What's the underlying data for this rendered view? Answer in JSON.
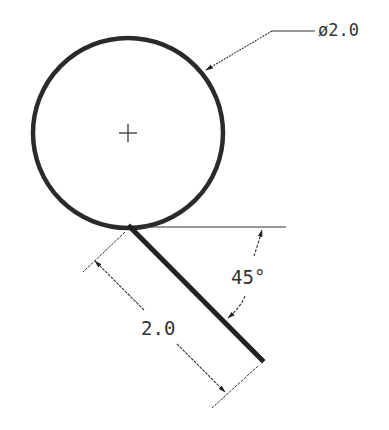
{
  "drawing": {
    "title": "Circle tangent line with dimensions",
    "circle": {
      "cx": 128,
      "cy": 133,
      "r": 95,
      "stroke": "#2a2a2a"
    },
    "center_mark": {
      "x": 128,
      "y": 133,
      "size": 9
    },
    "diameter_callout": {
      "text": "ø2.0",
      "leader_start": [
        207,
        69
      ],
      "leader_bend": [
        272,
        31
      ],
      "leader_end": [
        315,
        31
      ]
    },
    "tangent_line": {
      "x1": 130,
      "y1": 227,
      "x2": 262,
      "y2": 360
    },
    "reference_line": {
      "x1": 130,
      "y1": 227,
      "x2": 285,
      "y2": 227
    },
    "angle_dimension": {
      "text": "45°",
      "value": 45
    },
    "length_dimension": {
      "text": "2.0",
      "value": 2.0
    }
  }
}
